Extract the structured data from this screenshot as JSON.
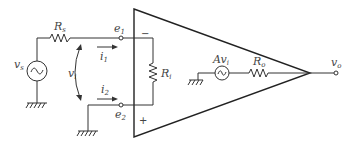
{
  "diagram": {
    "colors": {
      "stroke": "#333333",
      "text": "#444444",
      "background": "#ffffff"
    },
    "labels": {
      "source": {
        "main": "v",
        "sub": "s"
      },
      "source_resistor": {
        "main": "R",
        "sub": "s"
      },
      "input_voltage": {
        "main": "v",
        "sub": "i"
      },
      "current1": {
        "main": "i",
        "sub": "1"
      },
      "current2": {
        "main": "i",
        "sub": "2"
      },
      "node1": {
        "main": "e",
        "sub": "1"
      },
      "node2": {
        "main": "e",
        "sub": "2"
      },
      "input_resistor": {
        "main": "R",
        "sub": "i"
      },
      "dependent_source": {
        "main": "Av",
        "sub": "i"
      },
      "output_resistor": {
        "main": "R",
        "sub": "o"
      },
      "output": {
        "main": "v",
        "sub": "o"
      },
      "inverting_sign": "−",
      "noninverting_sign": "+"
    },
    "components": [
      {
        "id": "vs",
        "type": "ac-voltage-source"
      },
      {
        "id": "Rs",
        "type": "resistor"
      },
      {
        "id": "Ri",
        "type": "resistor"
      },
      {
        "id": "Avi",
        "type": "dependent-ac-source"
      },
      {
        "id": "Ro",
        "type": "resistor"
      },
      {
        "id": "opamp",
        "type": "triangle-amplifier"
      },
      {
        "id": "gnd1",
        "type": "ground"
      },
      {
        "id": "gnd2",
        "type": "ground"
      },
      {
        "id": "gnd3",
        "type": "ground"
      }
    ]
  }
}
